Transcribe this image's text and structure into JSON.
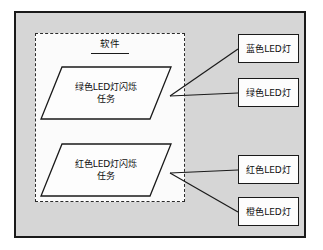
{
  "diagram": {
    "type": "block-diagram",
    "outer_boundary": {
      "label": ""
    },
    "software_partition": {
      "title": "软件",
      "tasks": [
        {
          "id": "green-blink-task",
          "line1": "绿色LED灯闪烁",
          "line2": "任务"
        },
        {
          "id": "red-blink-task",
          "line1": "红色LED灯闪烁",
          "line2": "任务"
        }
      ]
    },
    "hardware": [
      {
        "id": "blue-led",
        "label": "蓝色LED灯"
      },
      {
        "id": "green-led",
        "label": "绿色LED灯"
      },
      {
        "id": "red-led",
        "label": "红色LED灯"
      },
      {
        "id": "orange-led",
        "label": "橙色LED灯"
      }
    ],
    "connections": [
      {
        "from": "green-blink-task",
        "to": "blue-led"
      },
      {
        "from": "green-blink-task",
        "to": "green-led"
      },
      {
        "from": "red-blink-task",
        "to": "red-led"
      },
      {
        "from": "red-blink-task",
        "to": "orange-led"
      }
    ],
    "colors": {
      "page_background": "#ffffff",
      "outer_fill": "#d6d6d6",
      "partition_fill": "#fbfbfb",
      "node_fill": "#fdfdfd",
      "stroke": "#1a1a1a"
    }
  }
}
